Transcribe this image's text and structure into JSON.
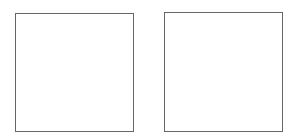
{
  "panels": [
    {
      "id": "box1",
      "label": "",
      "border_color": "#666666",
      "fill": "#ffffff"
    },
    {
      "id": "box2",
      "label": "",
      "border_color": "#666666",
      "fill": "#ffffff"
    }
  ]
}
